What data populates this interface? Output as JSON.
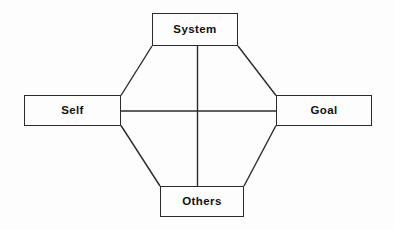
{
  "diagram": {
    "background_color": "#fdfdfd",
    "line_color": "#2b2b2b",
    "text_color": "#111111",
    "nodes": [
      {
        "id": "system",
        "label": "System",
        "position": "top"
      },
      {
        "id": "self",
        "label": "Self",
        "position": "left"
      },
      {
        "id": "goal",
        "label": "Goal",
        "position": "right"
      },
      {
        "id": "others",
        "label": "Others",
        "position": "bottom"
      }
    ],
    "edges": [
      {
        "from": "self",
        "to": "system",
        "style": "diagonal"
      },
      {
        "from": "system",
        "to": "goal",
        "style": "diagonal"
      },
      {
        "from": "self",
        "to": "others",
        "style": "diagonal"
      },
      {
        "from": "others",
        "to": "goal",
        "style": "diagonal"
      },
      {
        "from": "self",
        "to": "goal",
        "style": "horizontal"
      },
      {
        "from": "system",
        "to": "others",
        "style": "vertical"
      }
    ]
  }
}
